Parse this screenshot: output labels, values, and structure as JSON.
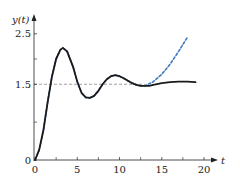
{
  "chart_data": {
    "type": "line",
    "title": "",
    "xlabel": "t",
    "ylabel": "y(t)",
    "xlim": [
      0,
      21.5
    ],
    "ylim": [
      0,
      2.85
    ],
    "grid": false,
    "legend": null,
    "x_ticks": [
      0,
      5,
      10,
      15,
      20
    ],
    "x_tick_labels": [
      "0",
      "5",
      "10",
      "15",
      "20"
    ],
    "x_minor_ticks": [
      2.5,
      7.5,
      12.5,
      17.5
    ],
    "y_ticks": [
      0,
      1.5,
      2.5
    ],
    "y_tick_labels": [
      "0",
      "1.5",
      "2.5"
    ],
    "y_minor_ticks": [
      0.75,
      2.0
    ],
    "reference_line": {
      "y": 1.5,
      "style": "dashed",
      "color": "#888888",
      "x_range": [
        0,
        13
      ]
    },
    "series": [
      {
        "name": "solid response",
        "style": "solid",
        "color": "#1a1a1a",
        "x": [
          0,
          0.5,
          1,
          1.5,
          2,
          2.5,
          3,
          3.3,
          3.8,
          4.5,
          5,
          5.5,
          6,
          6.5,
          7,
          7.5,
          8,
          8.5,
          9,
          9.5,
          10,
          10.5,
          11,
          11.5,
          12,
          12.5,
          13,
          13.5,
          14,
          15,
          16,
          17,
          18,
          19
        ],
        "values": [
          0,
          0.2,
          0.6,
          1.15,
          1.65,
          2.0,
          2.18,
          2.22,
          2.15,
          1.85,
          1.55,
          1.33,
          1.24,
          1.23,
          1.27,
          1.37,
          1.5,
          1.6,
          1.66,
          1.68,
          1.66,
          1.62,
          1.57,
          1.52,
          1.49,
          1.47,
          1.47,
          1.47,
          1.49,
          1.52,
          1.54,
          1.55,
          1.55,
          1.54
        ]
      },
      {
        "name": "dashed response",
        "style": "dashed",
        "color": "#3f78c0",
        "x": [
          0,
          0.5,
          1,
          1.5,
          2,
          2.5,
          3,
          3.3,
          3.8,
          4.5,
          5,
          5.5,
          6,
          6.5,
          7,
          7.5,
          8,
          8.5,
          9,
          9.5,
          10,
          10.5,
          11,
          11.5,
          12,
          12.5,
          13,
          14,
          15,
          16,
          17,
          18
        ],
        "values": [
          0,
          0.2,
          0.6,
          1.15,
          1.65,
          2.0,
          2.18,
          2.22,
          2.15,
          1.85,
          1.55,
          1.33,
          1.24,
          1.23,
          1.27,
          1.37,
          1.5,
          1.6,
          1.66,
          1.68,
          1.66,
          1.62,
          1.57,
          1.52,
          1.49,
          1.47,
          1.47,
          1.55,
          1.7,
          1.9,
          2.15,
          2.42
        ]
      }
    ]
  },
  "labels": {
    "x_axis": "t",
    "y_axis": "y(t)"
  }
}
